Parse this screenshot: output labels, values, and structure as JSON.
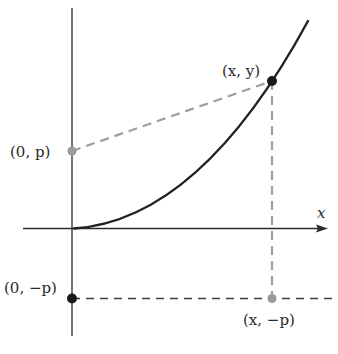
{
  "diagram": {
    "type": "parabola-focus-directrix",
    "axes": {
      "x_label": "x"
    },
    "points": {
      "focus": {
        "label": "(0, p)"
      },
      "curve_point": {
        "label": "(x, y)"
      },
      "directrix_on_y_axis": {
        "label": "(0, −p)"
      },
      "directrix_projection": {
        "label": "(x, −p)"
      }
    },
    "colors": {
      "axis": "#2a2a2a",
      "curve": "#222222",
      "dashed_gray": "#9e9e9e",
      "directrix": "#3a3a3a",
      "point_black": "#1a1a1a",
      "point_gray": "#9a9a9a"
    }
  }
}
